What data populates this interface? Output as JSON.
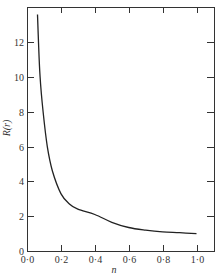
{
  "chart_data": {
    "type": "line",
    "title": "",
    "xlabel": "n",
    "ylabel": "R(r)",
    "xlim": [
      0.0,
      1.1
    ],
    "ylim": [
      0,
      14
    ],
    "grid": false,
    "legend": null,
    "x_ticks": [
      0.0,
      0.2,
      0.4,
      0.6,
      0.8,
      1.0
    ],
    "x_tick_labels": [
      "0·0",
      "0·2",
      "0·4",
      "0·6",
      "0·8",
      "1·0"
    ],
    "y_ticks": [
      0,
      2,
      4,
      6,
      8,
      10,
      12
    ],
    "y_tick_labels": [
      "0",
      "2",
      "4",
      "6",
      "8",
      "10",
      "12"
    ],
    "series": [
      {
        "name": "R(r)",
        "color": "#222222",
        "x": [
          0.062,
          0.068,
          0.077,
          0.095,
          0.12,
          0.15,
          0.2,
          0.25,
          0.3,
          0.4,
          0.5,
          0.6,
          0.7,
          0.8,
          0.9,
          1.0
        ],
        "y": [
          13.6,
          12.0,
          10.0,
          8.0,
          6.0,
          4.6,
          3.3,
          2.7,
          2.4,
          2.1,
          1.65,
          1.35,
          1.2,
          1.1,
          1.05,
          1.0
        ]
      }
    ]
  },
  "layout": {
    "frame": {
      "left": 27,
      "top": 7,
      "right": 214,
      "bottom": 251
    },
    "x0_px": 27,
    "x_px_per_unit": 169.5,
    "y0_px": 251,
    "y_px_per_unit": 17.4
  }
}
